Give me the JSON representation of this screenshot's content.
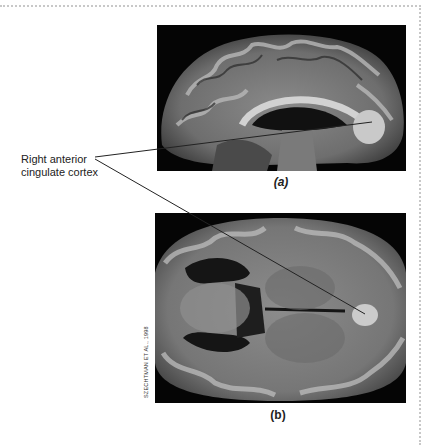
{
  "figure": {
    "label": {
      "line1": "Right anterior",
      "line2": "cingulate cortex"
    },
    "panels": [
      {
        "id": "a",
        "caption": "(a)",
        "view": "sagittal brain MRI"
      },
      {
        "id": "b",
        "caption": "(b)",
        "view": "axial brain MRI"
      }
    ],
    "credit": "SZECHTMAN ET AL., 1998",
    "colors": {
      "border": "#c8c8c8",
      "text": "#222222",
      "image_bg": "#050505",
      "highlight": "#c9c9c9"
    }
  }
}
